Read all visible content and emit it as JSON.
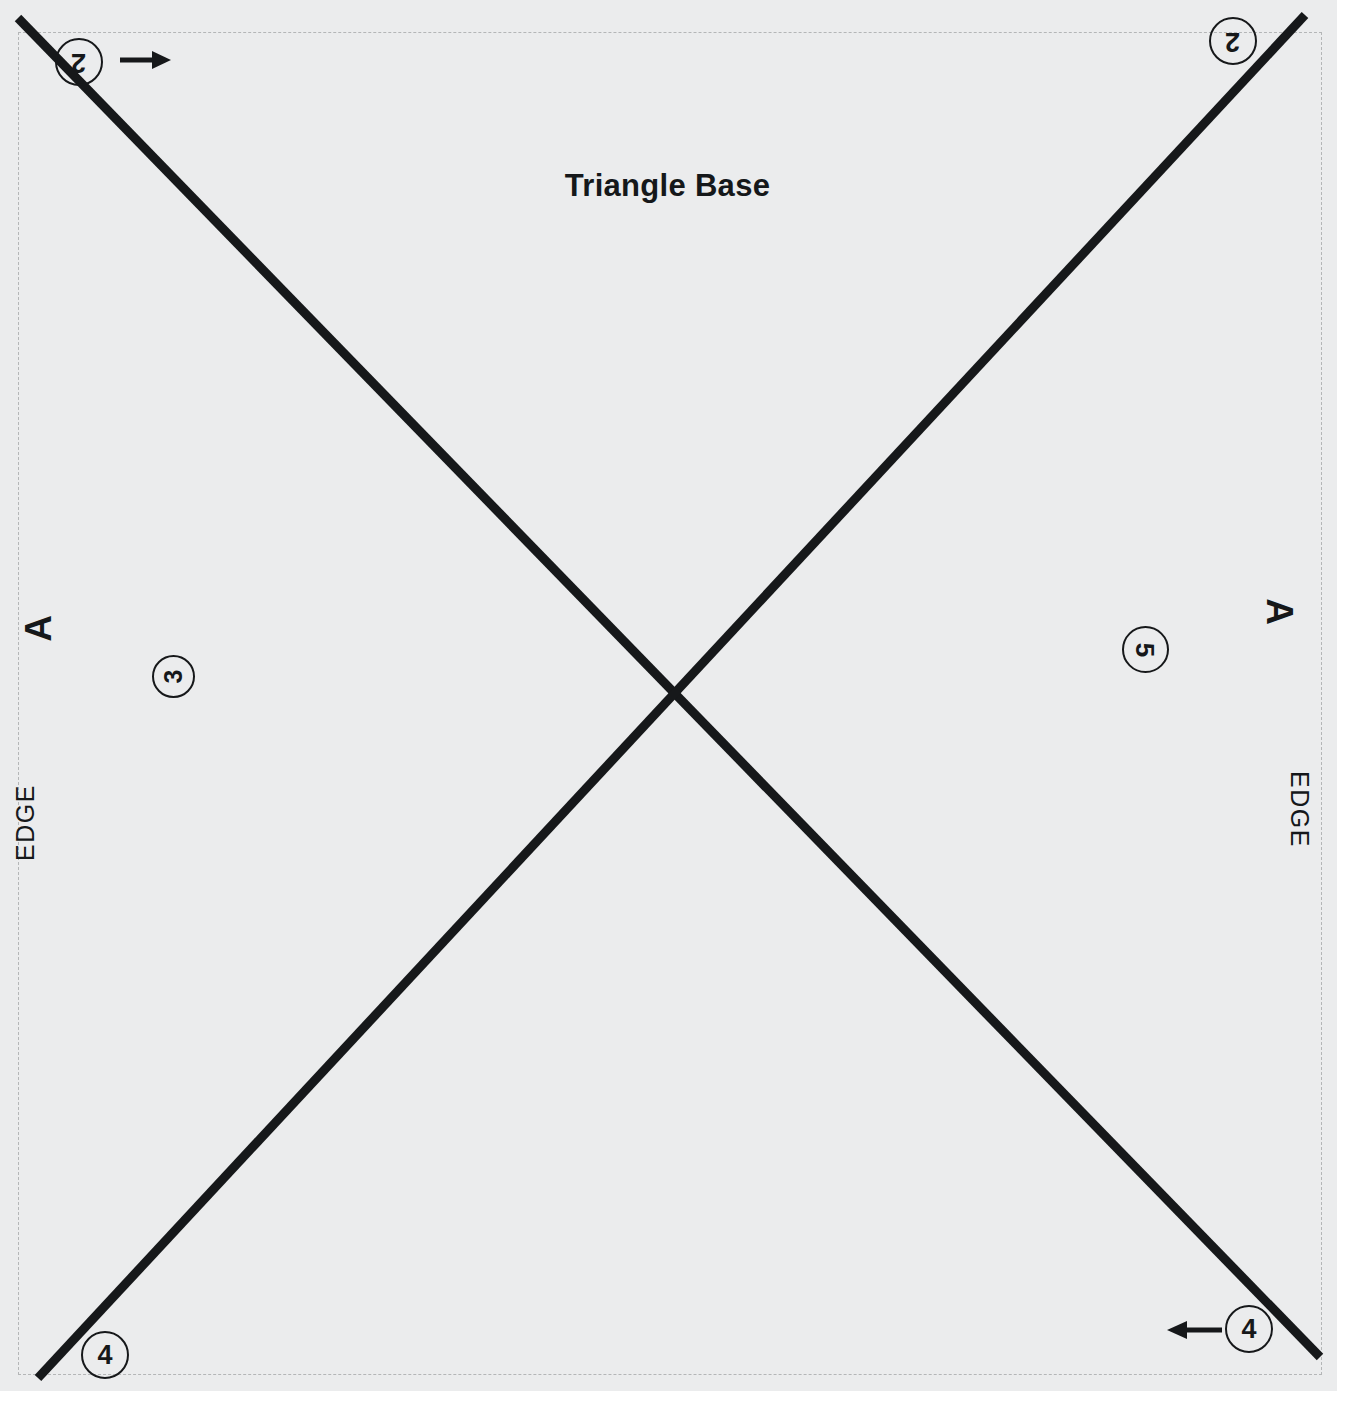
{
  "document": {
    "title": "Triangle Base",
    "type": "assembly-fold-diagram",
    "background_color": "#ebeced",
    "line_color": "#16181a",
    "dashed_border_color": "#b4b6b7",
    "canvas": {
      "width": 1351,
      "height": 1407
    }
  },
  "callouts": [
    {
      "id": "top-left",
      "number": "2",
      "rotation": 180,
      "x": 79,
      "y": 62
    },
    {
      "id": "top-right",
      "number": "2",
      "rotation": 180,
      "x": 1233,
      "y": 41
    },
    {
      "id": "left-middle",
      "number": "3",
      "rotation": -90,
      "x": 173,
      "y": 676
    },
    {
      "id": "right-middle",
      "number": "5",
      "rotation": 90,
      "x": 1145,
      "y": 649
    },
    {
      "id": "bottom-left",
      "number": "4",
      "rotation": 0,
      "x": 105,
      "y": 1355
    },
    {
      "id": "bottom-right",
      "number": "4",
      "rotation": 0,
      "x": 1249,
      "y": 1329
    }
  ],
  "edge_labels": {
    "left": {
      "edge": "EDGE",
      "letter": "A",
      "orientation": "rotated-90-ccw"
    },
    "right": {
      "edge": "EDGE",
      "letter": "A",
      "orientation": "rotated-90-cw"
    }
  },
  "arrows": [
    {
      "id": "top-left-arrow",
      "direction": "right",
      "x1": 120,
      "y1": 60,
      "x2": 171,
      "y2": 60
    },
    {
      "id": "bottom-right-arrow",
      "direction": "left",
      "x1": 1222,
      "y1": 1330,
      "x2": 1167,
      "y2": 1330
    }
  ],
  "fold_lines": [
    {
      "id": "diagonal-nw-se",
      "x1": 18,
      "y1": 18,
      "x2": 1320,
      "y2": 1357,
      "width": 9
    },
    {
      "id": "diagonal-ne-sw",
      "x1": 1305,
      "y1": 15,
      "x2": 38,
      "y2": 1378,
      "width": 9
    }
  ],
  "dashed_border": {
    "left": 18,
    "top": 32,
    "right": 1322,
    "bottom": 1375
  }
}
